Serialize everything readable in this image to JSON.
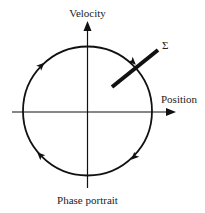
{
  "diagram": {
    "title": "Phase portrait",
    "axes": {
      "y_label": "Velocity",
      "x_label": "Position"
    },
    "section_label": "Σ",
    "orbit": {
      "shape": "circle",
      "direction": "clockwise",
      "arrow_count": 4
    },
    "colors": {
      "stroke": "#111111",
      "text": "#222222",
      "background": "#ffffff"
    }
  }
}
